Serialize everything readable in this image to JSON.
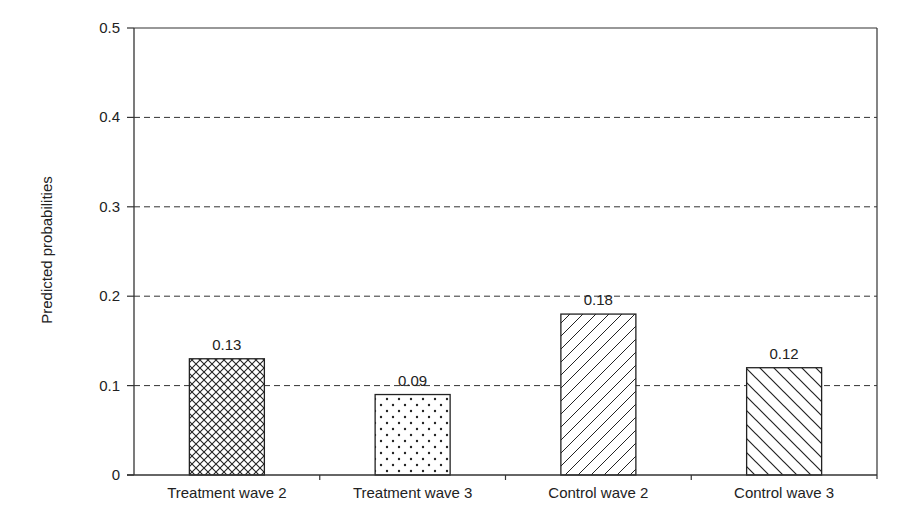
{
  "chart_data": {
    "type": "bar",
    "title": "",
    "xlabel": "",
    "ylabel": "Predicted probabilities",
    "ylim": [
      0,
      0.5
    ],
    "yticks": [
      "0",
      "0.1",
      "0.2",
      "0.3",
      "0.4",
      "0.5"
    ],
    "grid": "horizontal dashed",
    "legend": "none",
    "categories": [
      "Treatment wave 2",
      "Treatment wave 3",
      "Control wave 2",
      "Control wave 3"
    ],
    "values": [
      0.13,
      0.09,
      0.18,
      0.12
    ],
    "value_labels": [
      "0.13",
      "0.09",
      "0.18",
      "0.12"
    ],
    "patterns": [
      "crosshatch",
      "dots",
      "forward-diagonal",
      "backward-diagonal"
    ]
  },
  "colors": {
    "axis": "#333333",
    "bar_stroke": "#222222",
    "background": "#ffffff"
  }
}
